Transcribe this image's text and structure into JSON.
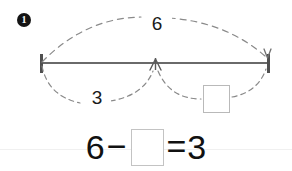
{
  "problem": {
    "number_label": "1",
    "number_icon": "filled-circle-number-icon"
  },
  "bar_model": {
    "total_label": "6",
    "known_part_label": "3",
    "unknown_part_label": "",
    "unknown_part_placeholder": "",
    "left_tick_icon": "vertical-tick-icon",
    "right_tick_icon": "vertical-tick-arrow-icon",
    "center_tick_icon": "up-arrow-tick-icon",
    "total_arc_icon": "dashed-arc-icon",
    "left_arc_icon": "dashed-arc-icon",
    "right_arc_icon": "dashed-arc-icon",
    "line_color": "#6a6a6a",
    "arc_color": "#7a7a7a",
    "box_border_color": "#b9b9b9"
  },
  "equation": {
    "minuend": "6",
    "minus_sign": "−",
    "answer_value": "",
    "answer_placeholder": "",
    "equals_sign": "=",
    "result": "3",
    "text_color": "#111111"
  },
  "page": {
    "background_color": "#ffffff",
    "rule_color": "#f0f0f0"
  }
}
